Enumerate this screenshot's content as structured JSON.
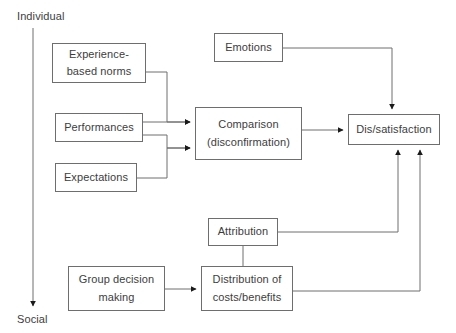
{
  "diagram": {
    "axis": {
      "top_label": "Individual",
      "bottom_label": "Social",
      "orientation": "vertical-down-arrow"
    },
    "nodes": [
      {
        "id": "experience-based-norms",
        "line1": "Experience-",
        "line2": "based norms",
        "x": 52,
        "y": 43,
        "w": 94,
        "h": 40
      },
      {
        "id": "performances",
        "line1": "Performances",
        "line2": "",
        "x": 55,
        "y": 113,
        "w": 88,
        "h": 29
      },
      {
        "id": "expectations",
        "line1": "Expectations",
        "line2": "",
        "x": 55,
        "y": 163,
        "w": 82,
        "h": 29
      },
      {
        "id": "emotions",
        "line1": "Emotions",
        "line2": "",
        "x": 214,
        "y": 33,
        "w": 69,
        "h": 29
      },
      {
        "id": "comparison",
        "line1": "Comparison",
        "line2": "(disconfirmation)",
        "x": 195,
        "y": 107,
        "w": 107,
        "h": 53
      },
      {
        "id": "dis-satisfaction",
        "line1": "Dis/satisfaction",
        "line2": "",
        "x": 348,
        "y": 114,
        "w": 92,
        "h": 31
      },
      {
        "id": "attribution",
        "line1": "Attribution",
        "line2": "",
        "x": 208,
        "y": 218,
        "w": 70,
        "h": 28
      },
      {
        "id": "group-decision-making",
        "line1": "Group decision",
        "line2": "making",
        "x": 68,
        "y": 266,
        "w": 97,
        "h": 45
      },
      {
        "id": "distribution-costs-benefits",
        "line1": "Distribution of",
        "line2": "costs/benefits",
        "x": 201,
        "y": 266,
        "w": 92,
        "h": 45
      }
    ],
    "edges": [
      {
        "id": "experience-norms-to-comparison",
        "from": "experience-based-norms",
        "to": "comparison",
        "arrow": true
      },
      {
        "id": "performances-to-comparison-top",
        "from": "performances",
        "to": "comparison",
        "arrow": true
      },
      {
        "id": "performances-to-comparison-bottom",
        "from": "performances",
        "to": "comparison",
        "arrow": true
      },
      {
        "id": "expectations-to-comparison",
        "from": "expectations",
        "to": "comparison",
        "arrow": true
      },
      {
        "id": "comparison-to-dis-satisfaction",
        "from": "comparison",
        "to": "dis-satisfaction",
        "arrow": true
      },
      {
        "id": "emotions-to-dis-satisfaction",
        "from": "emotions",
        "to": "dis-satisfaction",
        "arrow": true
      },
      {
        "id": "attribution-to-dis-satisfaction",
        "from": "attribution",
        "to": "dis-satisfaction",
        "arrow": true
      },
      {
        "id": "distribution-to-dis-satisfaction",
        "from": "distribution-costs-benefits",
        "to": "dis-satisfaction",
        "arrow": true
      },
      {
        "id": "attribution-to-distribution",
        "from": "attribution",
        "to": "distribution-costs-benefits",
        "arrow": false
      },
      {
        "id": "group-decision-to-distribution",
        "from": "group-decision-making",
        "to": "distribution-costs-benefits",
        "arrow": true
      }
    ],
    "colors": {
      "background": "#ffffff",
      "stroke": "#6e6e6e",
      "arrow_fill": "#1a1a1a",
      "text": "#3d3d3d"
    }
  }
}
